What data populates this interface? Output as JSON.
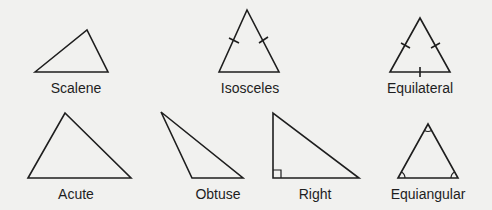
{
  "colors": {
    "background": "#f1f1ef",
    "stroke": "#1e1e1e",
    "text": "#1e1e1e"
  },
  "triangles": [
    {
      "name": "Scalene",
      "label": "Scalene",
      "marks": "none"
    },
    {
      "name": "Isosceles",
      "label": "Isosceles",
      "marks": "two equal-side ticks"
    },
    {
      "name": "Equilateral",
      "label": "Equilateral",
      "marks": "three equal-side ticks"
    },
    {
      "name": "Acute",
      "label": "Acute",
      "marks": "none"
    },
    {
      "name": "Obtuse",
      "label": "Obtuse",
      "marks": "none"
    },
    {
      "name": "Right",
      "label": "Right",
      "marks": "right-angle square"
    },
    {
      "name": "Equiangular",
      "label": "Equiangular",
      "marks": "three equal-angle arcs"
    }
  ]
}
